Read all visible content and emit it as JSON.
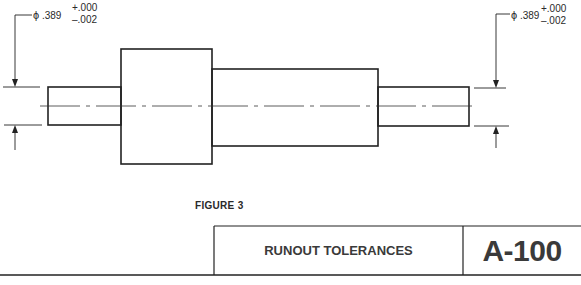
{
  "figure": {
    "label": "FIGURE 3",
    "title": "RUNOUT TOLERANCES",
    "drawing_number": "A-100"
  },
  "dimensions": {
    "left": {
      "symbol": "ϕ",
      "nominal": ".389",
      "upper_tolerance": "+.000",
      "lower_tolerance": "–.002"
    },
    "right": {
      "symbol": "ϕ",
      "nominal": ".389",
      "upper_tolerance": "+.000",
      "lower_tolerance": "–.002"
    }
  },
  "colors": {
    "line": "#222222",
    "paper": "#ffffff"
  }
}
